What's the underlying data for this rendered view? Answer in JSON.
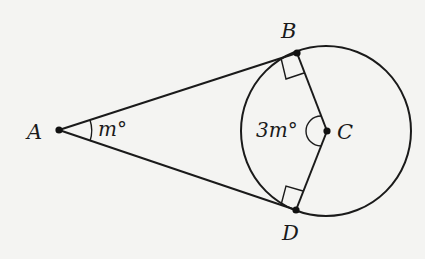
{
  "figure": {
    "type": "geometry",
    "points": {
      "A": {
        "label": "A",
        "x": 59,
        "y": 130
      },
      "B": {
        "label": "B",
        "x": 297,
        "y": 53
      },
      "C": {
        "label": "C",
        "x": 327,
        "y": 131
      },
      "D": {
        "label": "D",
        "x": 296,
        "y": 210
      }
    },
    "circle": {
      "center": "C",
      "cx": 326,
      "cy": 131,
      "r": 85
    },
    "segments": [
      "AB",
      "AD",
      "BC",
      "CD"
    ],
    "right_angles": [
      "ABC",
      "ADC"
    ],
    "angle_labels": {
      "angle_A": "m°",
      "angle_C": "3m°"
    }
  },
  "colors": {
    "background": "#f4f4f2",
    "ink": "#1a1a1a"
  }
}
